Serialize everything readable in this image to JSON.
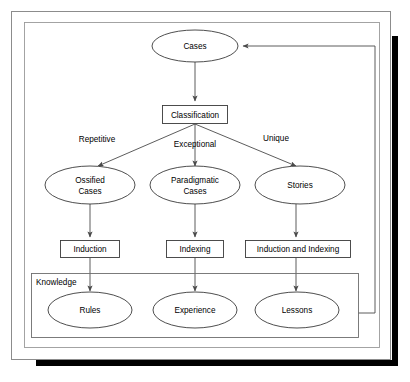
{
  "diagram": {
    "colors": {
      "background": "#ffffff",
      "shape_stroke": "#3a3a3a",
      "connector_stroke": "#4a4a4a",
      "group_stroke": "#6e6e6e",
      "frame_stroke": "#8c8c8c",
      "shadow": "#000000",
      "text": "#000000"
    },
    "nodes": {
      "cases": "Cases",
      "classification": "Classification",
      "ossified_cases_line1": "Ossified",
      "ossified_cases_line2": "Cases",
      "paradigmatic_cases_line1": "Paradigmatic",
      "paradigmatic_cases_line2": "Cases",
      "stories": "Stories",
      "induction": "Induction",
      "indexing": "Indexing",
      "induction_and_indexing": "Induction and Indexing",
      "rules": "Rules",
      "experience": "Experience",
      "lessons": "Lessons"
    },
    "group": {
      "knowledge_label": "Knowledge"
    },
    "edge_labels": {
      "repetitive": "Repetitive",
      "exceptional": "Exceptional",
      "unique": "Unique"
    }
  }
}
